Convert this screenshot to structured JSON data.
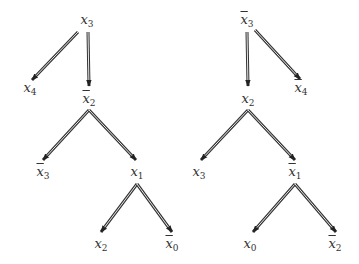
{
  "diagram": {
    "trees": [
      {
        "name": "left-tree",
        "nodes": [
          {
            "id": "L0",
            "var": "x",
            "sub": "3",
            "bar": false,
            "x": 87,
            "y": 21
          },
          {
            "id": "L1",
            "var": "x",
            "sub": "4",
            "bar": false,
            "x": 30,
            "y": 89
          },
          {
            "id": "L2",
            "var": "x",
            "sub": "2",
            "bar": true,
            "x": 89,
            "y": 100
          },
          {
            "id": "L3",
            "var": "x",
            "sub": "3",
            "bar": true,
            "x": 43,
            "y": 173
          },
          {
            "id": "L4",
            "var": "x",
            "sub": "1",
            "bar": false,
            "x": 137,
            "y": 173
          },
          {
            "id": "L5",
            "var": "x",
            "sub": "2",
            "bar": false,
            "x": 101,
            "y": 245
          },
          {
            "id": "L6",
            "var": "x",
            "sub": "0",
            "bar": true,
            "x": 172,
            "y": 245
          }
        ],
        "edges": [
          {
            "from": [
              78,
              32
            ],
            "to": [
              32,
              80
            ]
          },
          {
            "from": [
              88,
              32
            ],
            "to": [
              89,
              86
            ]
          },
          {
            "from": [
              89,
              110
            ],
            "to": [
              43,
              160
            ]
          },
          {
            "from": [
              89,
              110
            ],
            "to": [
              136,
              160
            ]
          },
          {
            "from": [
              137,
              184
            ],
            "to": [
              101,
              232
            ]
          },
          {
            "from": [
              137,
              184
            ],
            "to": [
              172,
              232
            ]
          }
        ]
      },
      {
        "name": "right-tree",
        "nodes": [
          {
            "id": "R0",
            "var": "x",
            "sub": "3",
            "bar": true,
            "x": 247,
            "y": 21
          },
          {
            "id": "R1",
            "var": "x",
            "sub": "4",
            "bar": true,
            "x": 301,
            "y": 89
          },
          {
            "id": "R2",
            "var": "x",
            "sub": "2",
            "bar": false,
            "x": 248,
            "y": 100
          },
          {
            "id": "R3",
            "var": "x",
            "sub": "3",
            "bar": false,
            "x": 199,
            "y": 173
          },
          {
            "id": "R4",
            "var": "x",
            "sub": "1",
            "bar": true,
            "x": 295,
            "y": 173
          },
          {
            "id": "R5",
            "var": "x",
            "sub": "0",
            "bar": false,
            "x": 250,
            "y": 245
          },
          {
            "id": "R6",
            "var": "x",
            "sub": "2",
            "bar": true,
            "x": 335,
            "y": 245
          }
        ],
        "edges": [
          {
            "from": [
              247,
              32
            ],
            "to": [
              248,
              86
            ]
          },
          {
            "from": [
              255,
              30
            ],
            "to": [
              300,
              79
            ]
          },
          {
            "from": [
              248,
              110
            ],
            "to": [
              201,
              160
            ]
          },
          {
            "from": [
              248,
              110
            ],
            "to": [
              295,
              160
            ]
          },
          {
            "from": [
              295,
              184
            ],
            "to": [
              253,
              232
            ]
          },
          {
            "from": [
              295,
              184
            ],
            "to": [
              336,
              232
            ]
          }
        ]
      }
    ]
  }
}
